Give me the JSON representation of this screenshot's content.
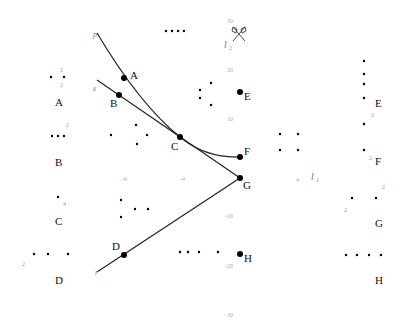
{
  "diagram": {
    "curves": [
      {
        "name": "p",
        "type": "curve",
        "label": "p",
        "points": [
          "A",
          "C",
          "F"
        ]
      },
      {
        "name": "s",
        "type": "line",
        "label": "s",
        "points": [
          "B",
          "C",
          "G"
        ]
      },
      {
        "name": "r",
        "type": "line",
        "label": "r",
        "points": [
          "D",
          "G"
        ]
      }
    ],
    "points": [
      {
        "label": "A",
        "x": 124,
        "y": 78
      },
      {
        "label": "B",
        "x": 119,
        "y": 95
      },
      {
        "label": "C",
        "x": 180,
        "y": 137
      },
      {
        "label": "D",
        "x": 124,
        "y": 255
      },
      {
        "label": "E",
        "x": 240,
        "y": 92
      },
      {
        "label": "F",
        "x": 240,
        "y": 157
      },
      {
        "label": "G",
        "x": 240,
        "y": 178
      },
      {
        "label": "H",
        "x": 240,
        "y": 254
      }
    ],
    "axis_labels": {
      "l1": "l",
      "l1_sub": "1",
      "l2": "l",
      "l2_sub": "2"
    },
    "ticks": {
      "y": [
        "30",
        "20",
        "10",
        "-10",
        "-20",
        "-30"
      ],
      "x": [
        "-6",
        "-4",
        "4"
      ]
    },
    "left_legend": [
      {
        "label": "A",
        "sup": "2",
        "sub": "2"
      },
      {
        "label": "B",
        "sup": "2"
      },
      {
        "label": "C",
        "sub": "4"
      },
      {
        "label": "D",
        "sub": "2"
      }
    ],
    "right_legend": [
      {
        "label": "E",
        "sub": "2"
      },
      {
        "label": "F",
        "sub": "2"
      },
      {
        "label": "G",
        "sup": "2",
        "sub": "2"
      },
      {
        "label": "H"
      }
    ]
  }
}
